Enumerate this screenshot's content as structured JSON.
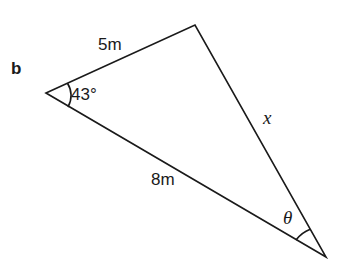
{
  "part_label": "b",
  "triangle": {
    "vertices": {
      "left": {
        "x": 46,
        "y": 93
      },
      "top": {
        "x": 195,
        "y": 25
      },
      "bottom": {
        "x": 326,
        "y": 257
      }
    },
    "stroke_color": "#1a1a1a"
  },
  "labels": {
    "side_top": "5m",
    "side_bottom": "8m",
    "side_right": "x",
    "angle_left": "43°",
    "angle_bottom": "θ"
  }
}
